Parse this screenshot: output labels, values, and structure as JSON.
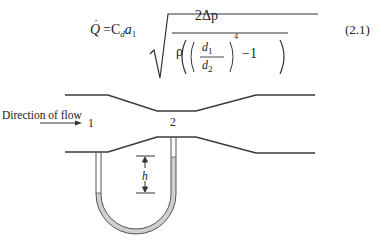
{
  "equation": {
    "lhs": "Q",
    "lhs_dot": "˙",
    "equals": "=",
    "coeff": "C",
    "coeff_sub": "d",
    "area": "a",
    "area_sub": "1",
    "numerator": "2Δp",
    "rho": "ρ",
    "d1": "d",
    "d1_sub": "1",
    "d2": "d",
    "d2_sub": "2",
    "exponent": "4",
    "minus_one": "−1",
    "number": "(2.1)"
  },
  "diagram": {
    "direction_label": "Direction of flow",
    "section_1_label": "1",
    "section_2_label": "2",
    "height_label": "h",
    "colors": {
      "line": "#3a3a3a",
      "liquid": "#cfcfcf"
    }
  }
}
